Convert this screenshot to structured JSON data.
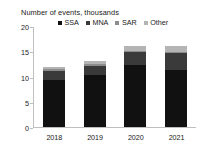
{
  "chart_data": {
    "type": "bar",
    "subtype": "stacked-column",
    "title": "Number of events, thousands",
    "xlabel": "",
    "ylabel": "",
    "categories": [
      "2018",
      "2019",
      "2020",
      "2021"
    ],
    "ylim": [
      0,
      20
    ],
    "yticks": [
      0,
      5,
      10,
      15,
      20
    ],
    "ytick_labels": [
      "0",
      "5",
      "10",
      "15",
      "20"
    ],
    "grid": false,
    "legend_position": "top",
    "series": [
      {
        "name": "SSA",
        "color": "#111111",
        "values": [
          9.3,
          10.3,
          12.3,
          11.3
        ]
      },
      {
        "name": "MNA",
        "color": "#3a3a3a",
        "values": [
          1.7,
          1.7,
          2.5,
          3.3
        ]
      },
      {
        "name": "SAR",
        "color": "#8c8c8c",
        "values": [
          0.4,
          0.4,
          0.3,
          0.3
        ]
      },
      {
        "name": "Other",
        "color": "#b4b4b4",
        "values": [
          0.4,
          0.6,
          0.9,
          1.1
        ]
      }
    ],
    "totals": [
      11.8,
      13.0,
      16.0,
      16.0
    ]
  },
  "axis": {
    "line_color": "#bfbfbf"
  }
}
